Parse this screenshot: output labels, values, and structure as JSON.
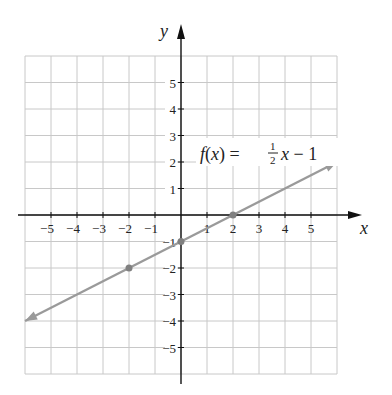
{
  "chart_data": {
    "type": "line",
    "title": "",
    "function_label": "f(x) = 1/2 x − 1",
    "function_label_parts": {
      "lhs": "f(x) =",
      "num": "1",
      "den": "2",
      "rhs": "x − 1"
    },
    "xlabel": "x",
    "ylabel": "y",
    "xlim": [
      -6,
      6
    ],
    "ylim": [
      -6,
      6
    ],
    "grid": true,
    "x_ticks": [
      -5,
      -4,
      -3,
      -2,
      -1,
      1,
      2,
      3,
      4,
      5
    ],
    "y_ticks": [
      5,
      4,
      3,
      2,
      1,
      -1,
      -2,
      -3,
      -4,
      -5
    ],
    "x_tick_labels": [
      "−5",
      "−4",
      "−3",
      "−2",
      "−1",
      "1",
      "2",
      "3",
      "4",
      "5"
    ],
    "y_tick_labels": [
      "5",
      "4",
      "3",
      "2",
      "1",
      "−1",
      "−2",
      "−3",
      "−4",
      "−5"
    ],
    "series": [
      {
        "name": "f(x) = 1/2 x − 1",
        "slope": 0.5,
        "intercept": -1,
        "x": [
          -6,
          6
        ],
        "y": [
          -4,
          2
        ],
        "arrows": "both",
        "color": "#9a9a9a"
      }
    ],
    "marked_points": [
      {
        "x": -2,
        "y": -2
      },
      {
        "x": 0,
        "y": -1
      },
      {
        "x": 2,
        "y": 0
      }
    ],
    "colors": {
      "grid": "#c8c8c8",
      "axis": "#111111",
      "line": "#9a9a9a",
      "point": "#808080"
    }
  }
}
